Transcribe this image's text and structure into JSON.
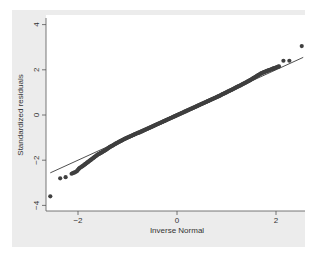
{
  "chart_data": {
    "type": "scatter",
    "title": "",
    "xlabel": "Inverse Normal",
    "ylabel": "Standardized residuals",
    "xlim": [
      -2.6,
      2.6
    ],
    "ylim": [
      -4.15,
      4.2
    ],
    "xticks": [
      -2,
      0,
      2
    ],
    "xtick_labels": [
      "−2",
      "0",
      "2"
    ],
    "yticks": [
      -4,
      -2,
      0,
      2,
      4
    ],
    "ytick_labels": [
      "−4",
      "−2",
      "0",
      "2",
      "4"
    ],
    "grid": false,
    "legend": null,
    "reference_line": {
      "x": [
        -2.56,
        2.55
      ],
      "y": [
        -2.56,
        2.55
      ],
      "label": "y = x"
    },
    "series": [
      {
        "name": "Standardized residuals",
        "marker": "circle",
        "color": "#3f3f3f",
        "points": [
          [
            -2.56,
            -3.6
          ],
          [
            -2.36,
            -2.8
          ],
          [
            -2.25,
            -2.75
          ],
          [
            -2.13,
            -2.6
          ],
          [
            -2.03,
            -2.5
          ],
          [
            -1.97,
            -2.35
          ],
          [
            -1.9,
            -2.25
          ],
          [
            -1.84,
            -2.15
          ],
          [
            -1.78,
            -2.05
          ],
          [
            -1.72,
            -1.95
          ],
          [
            -1.66,
            -1.85
          ],
          [
            -1.6,
            -1.75
          ],
          [
            -1.54,
            -1.68
          ],
          [
            -1.48,
            -1.6
          ],
          [
            -1.42,
            -1.52
          ],
          [
            -1.36,
            -1.42
          ],
          [
            -1.3,
            -1.35
          ],
          [
            -1.24,
            -1.27
          ],
          [
            -1.18,
            -1.2
          ],
          [
            -1.12,
            -1.13
          ],
          [
            -1.06,
            -1.06
          ],
          [
            -1.0,
            -1.0
          ],
          [
            -0.94,
            -0.94
          ],
          [
            -0.88,
            -0.88
          ],
          [
            -0.82,
            -0.82
          ],
          [
            -0.76,
            -0.77
          ],
          [
            -0.7,
            -0.71
          ],
          [
            -0.64,
            -0.65
          ],
          [
            -0.58,
            -0.59
          ],
          [
            -0.52,
            -0.53
          ],
          [
            -0.46,
            -0.47
          ],
          [
            -0.4,
            -0.41
          ],
          [
            -0.34,
            -0.35
          ],
          [
            -0.28,
            -0.29
          ],
          [
            -0.22,
            -0.23
          ],
          [
            -0.16,
            -0.17
          ],
          [
            -0.1,
            -0.11
          ],
          [
            -0.04,
            -0.05
          ],
          [
            0.02,
            0.01
          ],
          [
            0.08,
            0.07
          ],
          [
            0.14,
            0.13
          ],
          [
            0.2,
            0.19
          ],
          [
            0.26,
            0.25
          ],
          [
            0.32,
            0.31
          ],
          [
            0.38,
            0.37
          ],
          [
            0.44,
            0.43
          ],
          [
            0.5,
            0.49
          ],
          [
            0.56,
            0.55
          ],
          [
            0.62,
            0.61
          ],
          [
            0.68,
            0.67
          ],
          [
            0.74,
            0.73
          ],
          [
            0.8,
            0.79
          ],
          [
            0.86,
            0.85
          ],
          [
            0.92,
            0.92
          ],
          [
            0.98,
            0.98
          ],
          [
            1.04,
            1.05
          ],
          [
            1.1,
            1.11
          ],
          [
            1.16,
            1.18
          ],
          [
            1.22,
            1.25
          ],
          [
            1.28,
            1.31
          ],
          [
            1.34,
            1.38
          ],
          [
            1.4,
            1.45
          ],
          [
            1.46,
            1.52
          ],
          [
            1.52,
            1.6
          ],
          [
            1.58,
            1.68
          ],
          [
            1.64,
            1.76
          ],
          [
            1.7,
            1.84
          ],
          [
            1.76,
            1.9
          ],
          [
            1.82,
            1.95
          ],
          [
            1.88,
            2.0
          ],
          [
            1.94,
            2.05
          ],
          [
            2.0,
            2.1
          ],
          [
            2.06,
            2.15
          ],
          [
            2.15,
            2.4
          ],
          [
            2.27,
            2.4
          ],
          [
            2.52,
            3.05
          ]
        ]
      }
    ]
  },
  "figure": {
    "background": "#ececec",
    "plot_background": "#ffffff",
    "axis_color": "#555555",
    "line_color": "#222222"
  }
}
